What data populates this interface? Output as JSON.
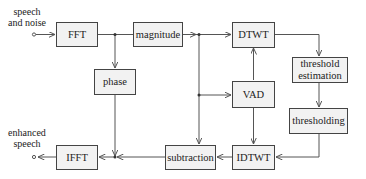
{
  "diagram": {
    "input_label_line1": "speech",
    "input_label_line2": "and noise",
    "output_label_line1": "enhanced",
    "output_label_line2": "speech",
    "blocks": {
      "fft": "FFT",
      "magnitude": "magnitude",
      "phase": "phase",
      "dtwt": "DTWT",
      "threshold_estimation_line1": "threshold",
      "threshold_estimation_line2": "estimation",
      "thresholding": "thresholding",
      "vad": "VAD",
      "idtwt": "IDTWT",
      "subtraction": "subtraction",
      "ifft": "IFFT"
    },
    "edges": [
      {
        "from": "input",
        "to": "FFT"
      },
      {
        "from": "FFT",
        "to": "magnitude"
      },
      {
        "from": "FFT",
        "to": "phase"
      },
      {
        "from": "magnitude",
        "to": "DTWT"
      },
      {
        "from": "magnitude",
        "to": "VAD"
      },
      {
        "from": "magnitude",
        "to": "subtraction"
      },
      {
        "from": "DTWT",
        "to": "threshold estimation"
      },
      {
        "from": "threshold estimation",
        "to": "thresholding"
      },
      {
        "from": "thresholding",
        "to": "IDTWT"
      },
      {
        "from": "VAD",
        "to": "DTWT"
      },
      {
        "from": "VAD",
        "to": "IDTWT"
      },
      {
        "from": "IDTWT",
        "to": "subtraction"
      },
      {
        "from": "subtraction",
        "to": "IFFT"
      },
      {
        "from": "phase",
        "to": "IFFT"
      },
      {
        "from": "IFFT",
        "to": "output"
      }
    ],
    "colors": {
      "line": "#555555",
      "box_fill": "#f2f2f2",
      "box_border": "#444444"
    }
  }
}
